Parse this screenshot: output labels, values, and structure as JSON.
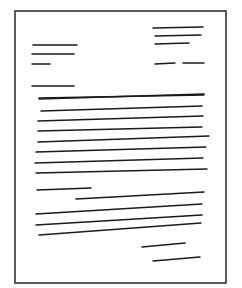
{
  "diagram": {
    "title": "",
    "colors": {
      "line": "#1a1a1a",
      "frame": "#333333",
      "background": "#ffffff"
    },
    "frame": {
      "x": 15,
      "y": 11,
      "w": 211,
      "h": 272
    },
    "sections": {
      "sender_address": [
        [
          153,
          28,
          203,
          27
        ],
        [
          155,
          36,
          201,
          35
        ],
        [
          155,
          44,
          189,
          43
        ]
      ],
      "date": [
        [
          155,
          64,
          175,
          63
        ],
        [
          183,
          63,
          204,
          63
        ]
      ],
      "recipient_address": [
        [
          33,
          45,
          77,
          45
        ],
        [
          32,
          54,
          74,
          54
        ],
        [
          32,
          64,
          50,
          64
        ]
      ],
      "salutation": [
        [
          32,
          86,
          74,
          86
        ]
      ],
      "body_paragraph_1": [
        [
          39,
          98,
          204,
          95
        ],
        [
          39,
          99,
          204,
          94
        ],
        [
          41,
          111,
          202,
          106
        ],
        [
          38,
          121,
          203,
          116
        ],
        [
          38,
          131,
          202,
          127
        ],
        [
          38,
          142,
          209,
          136
        ],
        [
          36,
          152,
          206,
          147
        ],
        [
          35,
          163,
          203,
          158
        ],
        [
          36,
          173,
          207,
          169
        ]
      ],
      "body_paragraph_2": [
        [
          37,
          190,
          91,
          188
        ],
        [
          76,
          199,
          204,
          192
        ],
        [
          36,
          214,
          202,
          204
        ],
        [
          36,
          225,
          202,
          215
        ],
        [
          39,
          235,
          201,
          223
        ]
      ],
      "closing": [
        [
          142,
          247,
          185,
          243
        ]
      ],
      "signature": [
        [
          153,
          261,
          200,
          257
        ]
      ]
    }
  }
}
